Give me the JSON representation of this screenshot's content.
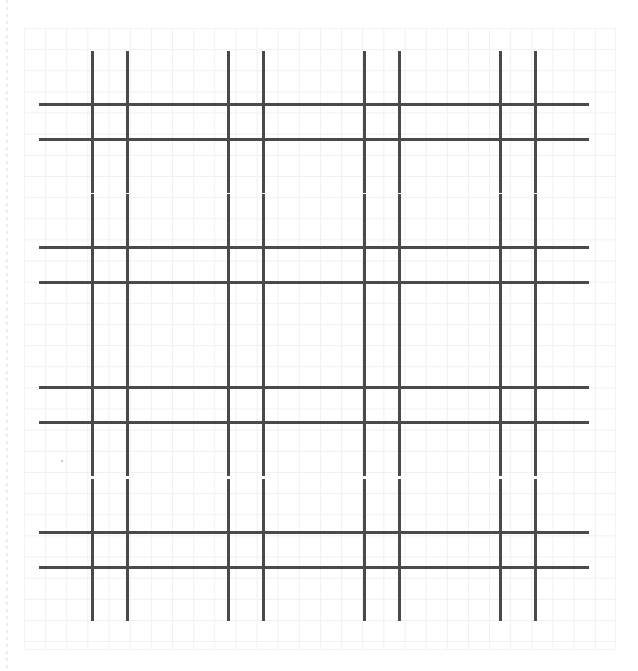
{
  "page": {
    "width": 638,
    "height": 671,
    "background_color": "#ffffff"
  },
  "paper": {
    "name": "graph-paper-sheet",
    "grid_square_px": 21.15,
    "grid_line_color": "#eef0f1",
    "left": 24,
    "top": 28,
    "width": 592,
    "height": 622,
    "margin_rule": {
      "name": "left-dotted-margin",
      "color": "#e9e9ea",
      "style": "dotted",
      "x": 6
    }
  },
  "figures": {
    "type": "tic-tac-toe-hash",
    "stroke_color": "#4a4a4d",
    "stroke_width": 2.6,
    "rows": 4,
    "columns": 4,
    "count": 16,
    "items": [
      {
        "id": 1,
        "row": 1,
        "col": 1,
        "x": 57,
        "y": 69,
        "w": 106,
        "h": 106,
        "cell": 35.3,
        "overhang": 18
      },
      {
        "id": 2,
        "row": 1,
        "col": 2,
        "x": 193,
        "y": 69,
        "w": 106,
        "h": 106,
        "cell": 35.3,
        "overhang": 18
      },
      {
        "id": 3,
        "row": 1,
        "col": 3,
        "x": 329,
        "y": 69,
        "w": 106,
        "h": 106,
        "cell": 35.3,
        "overhang": 18
      },
      {
        "id": 4,
        "row": 1,
        "col": 4,
        "x": 465,
        "y": 69,
        "w": 106,
        "h": 106,
        "cell": 35.3,
        "overhang": 18
      },
      {
        "id": 5,
        "row": 2,
        "col": 1,
        "x": 57,
        "y": 212,
        "w": 106,
        "h": 106,
        "cell": 35.3,
        "overhang": 18
      },
      {
        "id": 6,
        "row": 2,
        "col": 2,
        "x": 193,
        "y": 212,
        "w": 106,
        "h": 106,
        "cell": 35.3,
        "overhang": 18
      },
      {
        "id": 7,
        "row": 2,
        "col": 3,
        "x": 329,
        "y": 212,
        "w": 106,
        "h": 106,
        "cell": 35.3,
        "overhang": 18
      },
      {
        "id": 8,
        "row": 2,
        "col": 4,
        "x": 465,
        "y": 212,
        "w": 106,
        "h": 106,
        "cell": 35.3,
        "overhang": 18
      },
      {
        "id": 9,
        "row": 3,
        "col": 1,
        "x": 57,
        "y": 352,
        "w": 106,
        "h": 106,
        "cell": 35.3,
        "overhang": 18
      },
      {
        "id": 10,
        "row": 3,
        "col": 2,
        "x": 193,
        "y": 352,
        "w": 106,
        "h": 106,
        "cell": 35.3,
        "overhang": 18
      },
      {
        "id": 11,
        "row": 3,
        "col": 3,
        "x": 329,
        "y": 352,
        "w": 106,
        "h": 106,
        "cell": 35.3,
        "overhang": 18
      },
      {
        "id": 12,
        "row": 3,
        "col": 4,
        "x": 465,
        "y": 352,
        "w": 106,
        "h": 106,
        "cell": 35.3,
        "overhang": 18
      },
      {
        "id": 13,
        "row": 4,
        "col": 1,
        "x": 57,
        "y": 497,
        "w": 106,
        "h": 106,
        "cell": 35.3,
        "overhang": 18
      },
      {
        "id": 14,
        "row": 4,
        "col": 2,
        "x": 193,
        "y": 497,
        "w": 106,
        "h": 106,
        "cell": 35.3,
        "overhang": 18
      },
      {
        "id": 15,
        "row": 4,
        "col": 3,
        "x": 329,
        "y": 497,
        "w": 106,
        "h": 106,
        "cell": 35.3,
        "overhang": 18
      },
      {
        "id": 16,
        "row": 4,
        "col": 4,
        "x": 465,
        "y": 497,
        "w": 106,
        "h": 106,
        "cell": 35.3,
        "overhang": 18
      }
    ]
  },
  "marks": [
    {
      "name": "stray-pencil-dot",
      "x": 61,
      "y": 460,
      "color": "#b9b9bb"
    }
  ]
}
